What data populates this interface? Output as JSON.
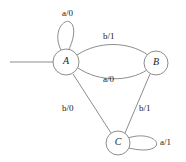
{
  "diagram": {
    "type": "state-transition-diagram",
    "line_color": "#8d8d8d",
    "text_color": "#1a1a1a",
    "background": "#ffffff",
    "states": [
      {
        "id": "A",
        "label": "A",
        "cx": 66,
        "cy": 62,
        "r": 13
      },
      {
        "id": "B",
        "label": "B",
        "cx": 156,
        "cy": 63,
        "r": 12
      },
      {
        "id": "C",
        "label": "C",
        "cx": 118,
        "cy": 143,
        "r": 12
      }
    ],
    "start_state": "A",
    "transitions": [
      {
        "name": "a-loop-on-A",
        "from": "A",
        "to": "A",
        "input": "a",
        "output": "0",
        "label": "a/0",
        "label_x": 62,
        "label_y": 9
      },
      {
        "name": "b-A-to-B",
        "from": "A",
        "to": "B",
        "input": "b",
        "output": "1",
        "label": "b/1",
        "label_x": 103,
        "label_y": 32
      },
      {
        "name": "a-B-to-A",
        "from": "B",
        "to": "A",
        "input": "a",
        "output": "0",
        "label": "a/0",
        "label_x": 103,
        "label_y": 75
      },
      {
        "name": "b-A-to-C",
        "from": "A",
        "to": "C",
        "input": "b",
        "output": "0",
        "label": "b/0",
        "label_x": 62,
        "label_y": 104
      },
      {
        "name": "b-B-to-C",
        "from": "B",
        "to": "C",
        "input": "b",
        "output": "1",
        "label": "b/1",
        "label_x": 139,
        "label_y": 104
      },
      {
        "name": "a-loop-on-C",
        "from": "C",
        "to": "C",
        "input": "a",
        "output": "1",
        "label": "a/1",
        "label_x": 160,
        "label_y": 138
      }
    ]
  }
}
